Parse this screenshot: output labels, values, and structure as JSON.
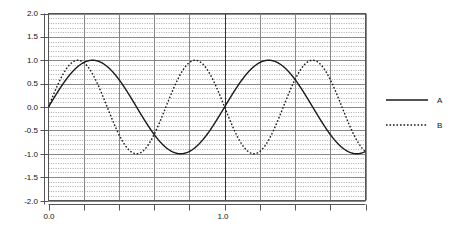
{
  "chart_data": {
    "type": "line",
    "title": "",
    "xlabel": "",
    "ylabel": "",
    "xlim": [
      0.0,
      1.8
    ],
    "ylim": [
      -2.0,
      2.0
    ],
    "grid": true,
    "grid_style": "major solid horizontal and vertical, dense minor dotted horizontal",
    "legend_position": "right outside",
    "x_ticks": [
      0.0,
      0.2,
      0.4,
      0.6,
      0.8,
      1.0,
      1.2,
      1.4,
      1.6,
      1.8
    ],
    "x_tick_labels": [
      "0.0",
      "",
      "",
      "",
      "",
      "1.0",
      "",
      "",
      "",
      ""
    ],
    "y_ticks": [
      -2.0,
      -1.5,
      -1.0,
      -0.5,
      0.0,
      0.5,
      1.0,
      1.5,
      2.0
    ],
    "y_tick_labels": [
      "-2.0",
      "-1.5",
      "-1.0",
      "-0.5",
      "0.0",
      "0.5",
      "1.0",
      "1.5",
      "2.0"
    ],
    "series": [
      {
        "name": "A",
        "style": "solid",
        "color": "#1a1a1a",
        "amplitude": 1.0,
        "period": 1.0,
        "phase": 0.0,
        "formula": "sin(2*pi*x)",
        "x": [
          0.0,
          0.05,
          0.1,
          0.15,
          0.2,
          0.25,
          0.3,
          0.35,
          0.4,
          0.45,
          0.5,
          0.55,
          0.6,
          0.65,
          0.7,
          0.75,
          0.8,
          0.85,
          0.9,
          0.95,
          1.0,
          1.05,
          1.1,
          1.15,
          1.2,
          1.25,
          1.3,
          1.35,
          1.4,
          1.45,
          1.5,
          1.55,
          1.6,
          1.65,
          1.7,
          1.75,
          1.8
        ],
        "values": [
          0.0,
          0.31,
          0.59,
          0.81,
          0.95,
          1.0,
          0.95,
          0.81,
          0.59,
          0.31,
          0.0,
          -0.31,
          -0.59,
          -0.81,
          -0.95,
          -1.0,
          -0.95,
          -0.81,
          -0.59,
          -0.31,
          0.0,
          0.31,
          0.59,
          0.81,
          0.95,
          1.0,
          0.95,
          0.81,
          0.59,
          0.31,
          0.0,
          -0.31,
          -0.59,
          -0.81,
          -0.95,
          -1.0,
          -0.95
        ]
      },
      {
        "name": "B",
        "style": "dotted",
        "color": "#1a1a1a",
        "amplitude": 1.0,
        "period": 0.6666,
        "phase": 0.0,
        "formula": "sin(3*pi*x)",
        "x": [
          0.0,
          0.05,
          0.1,
          0.15,
          0.2,
          0.25,
          0.3,
          0.35,
          0.4,
          0.45,
          0.5,
          0.55,
          0.6,
          0.65,
          0.7,
          0.75,
          0.8,
          0.85,
          0.9,
          0.95,
          1.0,
          1.05,
          1.1,
          1.15,
          1.2,
          1.25,
          1.3,
          1.35,
          1.4,
          1.45,
          1.5,
          1.55,
          1.6,
          1.65,
          1.7,
          1.75,
          1.8
        ],
        "values": [
          0.0,
          0.45,
          0.81,
          0.99,
          0.95,
          0.71,
          0.31,
          -0.16,
          -0.59,
          -0.89,
          -1.0,
          -0.89,
          -0.59,
          -0.16,
          0.31,
          0.71,
          0.95,
          0.99,
          0.81,
          0.45,
          0.0,
          -0.45,
          -0.81,
          -0.99,
          -0.95,
          -0.71,
          -0.31,
          0.16,
          0.59,
          0.89,
          1.0,
          0.89,
          0.59,
          0.16,
          -0.31,
          -0.71,
          -0.95
        ]
      }
    ],
    "legend": [
      {
        "label": "A",
        "style": "solid"
      },
      {
        "label": "B",
        "style": "dotted"
      }
    ]
  },
  "axes": {
    "frame_color": "#555555",
    "major_grid_color": "#888888",
    "minor_grid_color": "#aaaaaa"
  }
}
